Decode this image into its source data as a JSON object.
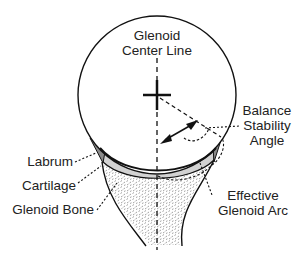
{
  "diagram": {
    "type": "anatomical-schematic",
    "labels": {
      "center_line_1": "Glenoid",
      "center_line_2": "Center Line",
      "bsa_1": "Balance",
      "bsa_2": "Stability",
      "bsa_3": "Angle",
      "labrum": "Labrum",
      "cartilage": "Cartilage",
      "glenoid_bone": "Glenoid Bone",
      "effective_1": "Effective",
      "effective_2": "Glenoid Arc"
    },
    "colors": {
      "line": "#111111",
      "labrum_fill": "#8a8a8a",
      "cartilage_fill": "#d2d2d2",
      "bone_stipple": "#777777",
      "background": "#ffffff"
    }
  }
}
